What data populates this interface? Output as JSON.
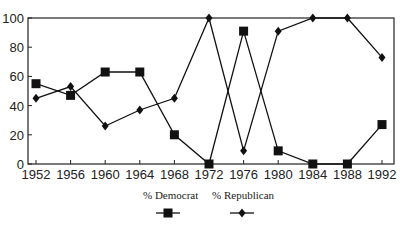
{
  "chart_data": {
    "type": "line",
    "title": "",
    "xlabel": "",
    "ylabel": "",
    "x": [
      1952,
      1956,
      1960,
      1964,
      1968,
      1972,
      1976,
      1980,
      1984,
      1988,
      1992
    ],
    "xticks": [
      "1952",
      "1956",
      "1960",
      "1964",
      "1968",
      "1972",
      "1976",
      "1980",
      "1984",
      "1988",
      "1992"
    ],
    "yticks": [
      "0",
      "20",
      "40",
      "60",
      "80",
      "100"
    ],
    "ylim": [
      0,
      100
    ],
    "grid": false,
    "legend_position": "bottom",
    "series": [
      {
        "name": "% Democrat",
        "marker": "square",
        "color": "#111111",
        "values": [
          55,
          47,
          63,
          63,
          20,
          0,
          91,
          9,
          0,
          0,
          27
        ]
      },
      {
        "name": "% Republican",
        "marker": "diamond",
        "color": "#111111",
        "values": [
          45,
          53,
          26,
          37,
          45,
          100,
          9,
          91,
          100,
          100,
          73
        ]
      }
    ]
  }
}
